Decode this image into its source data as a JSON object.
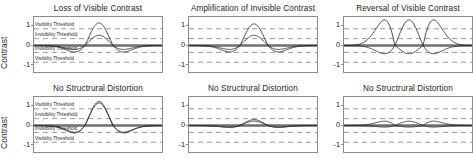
{
  "figure": {
    "y_axis_label": "Contrast",
    "y_ticks": [
      "1",
      "0",
      "-1"
    ],
    "threshold_labels": {
      "visibility": "Visibility Threshold",
      "invisibility": "Invisibility Threshold"
    },
    "colors": {
      "reference_curve": "#6f6f6f",
      "test_curve": "#2b2b2b",
      "threshold_dash": "#8f8f8f",
      "axes_border": "#8c8c8c",
      "background": "#ffffff"
    }
  },
  "panels": [
    {
      "id": "top-left",
      "title": "Loss of Visible Contrast"
    },
    {
      "id": "top-mid",
      "title": "Amplification of Invisible Contrast"
    },
    {
      "id": "top-right",
      "title": "Reversal of Visible Contrast"
    },
    {
      "id": "bot-left",
      "title": "No Structrural Distortion"
    },
    {
      "id": "bot-mid",
      "title": "No Structrural Distortion"
    },
    {
      "id": "bot-right",
      "title": "No Structrural Distortion"
    }
  ],
  "chart_data": {
    "type": "line",
    "xlabel": "",
    "ylabel": "Contrast",
    "ylim": [
      -1.45,
      1.45
    ],
    "xlim": [
      0,
      1
    ],
    "grid": false,
    "yticks": [
      1,
      0,
      -1
    ],
    "threshold_lines": {
      "visibility_positive": 0.85,
      "invisibility_positive": 0.35,
      "invisibility_negative": -0.35,
      "visibility_negative": -0.85,
      "style": "dashed"
    },
    "annotations": [
      "Visibility Threshold",
      "Invisibility Threshold",
      "Invisibility Threshold",
      "Visibility Threshold"
    ],
    "legend_position": "none",
    "panels": [
      {
        "id": "top-left",
        "title": "Loss of Visible Contrast",
        "description": "Reference mexican-hat wavelet peaking above visibility threshold; test signal retains same shape but reduced peak amplitude, falling between the invisibility and visibility thresholds.",
        "series": [
          {
            "name": "reference",
            "role": "flat-baseline",
            "amplitude": 0.0,
            "style": "thick-gray"
          },
          {
            "name": "original",
            "role": "wavelet",
            "peak": 1.15,
            "trough": -0.33,
            "style": "thin-dark"
          },
          {
            "name": "distorted",
            "role": "wavelet",
            "peak": 0.52,
            "trough": -0.2,
            "style": "thin-dark"
          }
        ]
      },
      {
        "id": "top-mid",
        "title": "Amplification of Invisible Contrast",
        "description": "Low-amplitude sub-threshold wavelet is amplified so its peak rises above the visibility threshold.",
        "series": [
          {
            "name": "reference",
            "role": "flat-baseline",
            "amplitude": 0.0,
            "style": "thick-gray"
          },
          {
            "name": "original",
            "role": "wavelet",
            "peak": 0.52,
            "trough": -0.2,
            "style": "thin-dark"
          },
          {
            "name": "amplified",
            "role": "wavelet",
            "peak": 1.1,
            "trough": -0.33,
            "style": "thin-dark"
          }
        ]
      },
      {
        "id": "top-right",
        "title": "Reversal of Visible Contrast",
        "description": "A visible wavelet and its sign-flipped mirror, crossing zero and forming lens-shaped intersections; peak magnitude exceeds the visibility threshold in both polarities.",
        "series": [
          {
            "name": "reference",
            "role": "flat-baseline",
            "amplitude": 0.0,
            "style": "thick-gray"
          },
          {
            "name": "original",
            "role": "wavelet",
            "peak": 1.3,
            "trough": -0.42,
            "style": "thin-dark"
          },
          {
            "name": "reversed",
            "role": "wavelet-inverted",
            "peak": 0.42,
            "trough": -1.3,
            "style": "thin-dark"
          }
        ]
      },
      {
        "id": "bot-left",
        "title": "No Structrural Distortion",
        "description": "Two nearly coincident high-amplitude wavelets; the distorted signal tracks the original closely so no structural change is visible.",
        "series": [
          {
            "name": "reference",
            "role": "flat-baseline",
            "amplitude": 0.0,
            "style": "thick-gray"
          },
          {
            "name": "original",
            "role": "wavelet",
            "peak": 1.22,
            "trough": -0.38,
            "style": "thin-dark"
          },
          {
            "name": "distorted",
            "role": "wavelet",
            "peak": 1.14,
            "trough": -0.34,
            "style": "thin-dark"
          }
        ]
      },
      {
        "id": "bot-mid",
        "title": "No Structrural Distortion",
        "description": "Two low-amplitude wavelets both well below the invisibility threshold; difference between them is imperceptible.",
        "series": [
          {
            "name": "reference",
            "role": "flat-baseline",
            "amplitude": 0.0,
            "style": "thick-gray"
          },
          {
            "name": "original",
            "role": "wavelet",
            "peak": 0.3,
            "trough": -0.1,
            "style": "thin-dark"
          },
          {
            "name": "distorted",
            "role": "wavelet",
            "peak": 0.22,
            "trough": -0.08,
            "style": "thin-dark"
          }
        ]
      },
      {
        "id": "bot-right",
        "title": "No Structrural Distortion",
        "description": "A very low-amplitude wavelet and its mirror overlap the baseline, producing small lens-shaped crossings entirely inside the invisibility band.",
        "series": [
          {
            "name": "reference",
            "role": "flat-baseline",
            "amplitude": 0.0,
            "style": "thick-gray"
          },
          {
            "name": "original",
            "role": "wavelet",
            "peak": 0.22,
            "trough": -0.08,
            "style": "thin-dark"
          },
          {
            "name": "reversed",
            "role": "wavelet-inverted",
            "peak": 0.08,
            "trough": -0.22,
            "style": "thin-dark"
          }
        ]
      }
    ]
  }
}
